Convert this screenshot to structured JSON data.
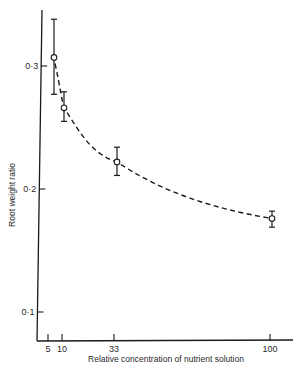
{
  "chart_data": {
    "type": "line",
    "title": "",
    "xlabel": "Relative concentration of nutrient solution",
    "ylabel": "Root weight ratio",
    "x_ticks": [
      5,
      10,
      33,
      100
    ],
    "y_ticks": [
      "0·1",
      "0·2",
      "0·3"
    ],
    "y_tick_values": [
      0.1,
      0.2,
      0.3
    ],
    "ylim": [
      0.078,
      0.345
    ],
    "xlim": [
      0,
      107
    ],
    "grid": false,
    "legend": null,
    "series": [
      {
        "name": "Root weight ratio (mean ± error)",
        "marker": "open-circle",
        "line_style": "dashed fitted curve",
        "x": [
          5,
          10,
          33,
          100
        ],
        "values": [
          0.307,
          0.266,
          0.222,
          0.176
        ],
        "error_upper": [
          0.338,
          0.279,
          0.234,
          0.182
        ],
        "error_lower": [
          0.277,
          0.255,
          0.211,
          0.169
        ]
      }
    ]
  },
  "layout": {
    "ink_color": "#1a1a1a",
    "background": "#ffffff"
  }
}
